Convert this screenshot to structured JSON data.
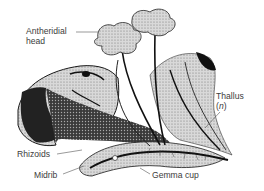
{
  "figure": {
    "labels": {
      "antheridial_head_line1": "Antheridial",
      "antheridial_head_line2": "head",
      "thallus_line1": "Thallus",
      "thallus_ploidy": "n",
      "rhizoids": "Rhizoids",
      "midrib": "Midrib",
      "gemma_cup": "Gemma cup"
    },
    "colors": {
      "ink": "#1a1a1a",
      "stipple_mid": "#8a8a8a",
      "stipple_light": "#c8c8c8",
      "label_text": "#3c3c3c",
      "leader_line": "#555555",
      "background": "#ffffff"
    }
  }
}
